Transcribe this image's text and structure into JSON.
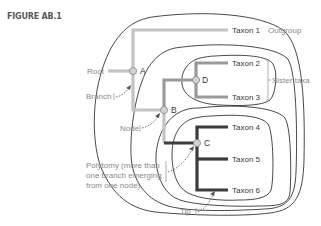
{
  "figure": {
    "label": "FIGURE AB.1"
  },
  "tree": {
    "taxa": [
      {
        "id": "taxon1",
        "label": "Taxon 1",
        "group": "outgroup"
      },
      {
        "id": "taxon2",
        "label": "Taxon 2",
        "group": "sister"
      },
      {
        "id": "taxon3",
        "label": "Taxon 3",
        "group": "sister"
      },
      {
        "id": "taxon4",
        "label": "Taxon 4",
        "group": "polytomy"
      },
      {
        "id": "taxon5",
        "label": "Taxon 5",
        "group": "polytomy"
      },
      {
        "id": "taxon6",
        "label": "Taxon 6",
        "group": "polytomy"
      }
    ],
    "nodes": [
      {
        "id": "A",
        "label": "A"
      },
      {
        "id": "B",
        "label": "B"
      },
      {
        "id": "C",
        "label": "C"
      },
      {
        "id": "D",
        "label": "D"
      }
    ],
    "edges": [
      [
        "root",
        "A"
      ],
      [
        "A",
        "taxon1"
      ],
      [
        "A",
        "B"
      ],
      [
        "B",
        "D"
      ],
      [
        "B",
        "C"
      ],
      [
        "D",
        "taxon2"
      ],
      [
        "D",
        "taxon3"
      ],
      [
        "C",
        "taxon4"
      ],
      [
        "C",
        "taxon5"
      ],
      [
        "C",
        "taxon6"
      ]
    ]
  },
  "annotations": {
    "root": "Root",
    "branch": "Branch",
    "node": "Node",
    "polytomy_line1": "Polytomy (more than",
    "polytomy_line2": "one branch emerging",
    "polytomy_line3": "from one node)",
    "tip": "Tip",
    "outgroup": "Outgroup",
    "sister_taxa": "Sister taxa"
  },
  "colors": {
    "outgroup_branch": "#c4c4c4",
    "sister_branch": "#9a9a9a",
    "polytomy_branch": "#3c3c3c",
    "clade_outline": "#1a1a1a",
    "annotation_text": "#8a8a8a",
    "taxon_text": "#3a3a3a",
    "node_fill": "#cfcfcf"
  }
}
